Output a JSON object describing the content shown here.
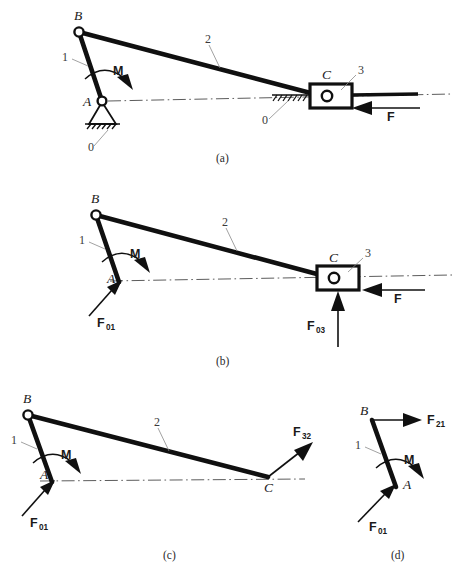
{
  "figure": {
    "background": "#ffffff",
    "ink": "#101010"
  },
  "panels": [
    {
      "key": "a",
      "caption": "(a)",
      "points": {
        "B": "B",
        "A": "A",
        "C": "C"
      },
      "links": {
        "one": "1",
        "two": "2",
        "three": "3"
      },
      "ground": {
        "pivot": "0",
        "slider": "0"
      },
      "moment": "M",
      "force": "F"
    },
    {
      "key": "b",
      "caption": "(b)",
      "points": {
        "B": "B",
        "A": "A",
        "C": "C"
      },
      "links": {
        "one": "1",
        "two": "2",
        "three": "3"
      },
      "moment": "M",
      "forces": {
        "applied": "F",
        "reaction_a": {
          "base": "F",
          "sub": "01"
        },
        "reaction_c": {
          "base": "F",
          "sub": "03"
        }
      }
    },
    {
      "key": "c",
      "caption": "(c)",
      "points": {
        "B": "B",
        "A": "A",
        "C": "C"
      },
      "links": {
        "one": "1",
        "two": "2"
      },
      "moment": "M",
      "forces": {
        "reaction_a": {
          "base": "F",
          "sub": "01"
        },
        "at_c": {
          "base": "F",
          "sub": "32"
        }
      }
    },
    {
      "key": "d",
      "caption": "(d)",
      "points": {
        "B": "B",
        "A": "A"
      },
      "links": {
        "one": "1"
      },
      "moment": "M",
      "forces": {
        "reaction_a": {
          "base": "F",
          "sub": "01"
        },
        "at_b": {
          "base": "F",
          "sub": "21"
        }
      }
    }
  ]
}
